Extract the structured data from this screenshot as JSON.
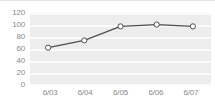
{
  "chart_data": {
    "type": "line",
    "title": "",
    "xlabel": "",
    "ylabel": "",
    "categories": [
      "6/03",
      "6/04",
      "6/05",
      "6/06",
      "6/07"
    ],
    "values": [
      63,
      75,
      98,
      101,
      98
    ],
    "series": [
      {
        "name": "",
        "values": [
          63,
          75,
          98,
          101,
          98
        ]
      }
    ],
    "ylim": [
      0,
      120
    ],
    "y_ticks": [
      0,
      20,
      40,
      60,
      80,
      100,
      120
    ],
    "y_tick_labels": [
      "0",
      "20",
      "40",
      "60",
      "80",
      "100",
      "120"
    ],
    "x_tick_labels": [
      "6/03",
      "6/04",
      "6/05",
      "6/06",
      "6/07"
    ],
    "grid": true,
    "grid_orientation": "horizontal",
    "legend": false,
    "legend_position": "none",
    "marker": "circle-open",
    "line_color": "#4d4d4d",
    "marker_fill": "#ffffff",
    "marker_stroke": "#4d4d4d",
    "plot_background": "#ededed",
    "gridline_color": "#fbfbfb",
    "tick_label_color": "#8a8a8a",
    "annotations": []
  }
}
